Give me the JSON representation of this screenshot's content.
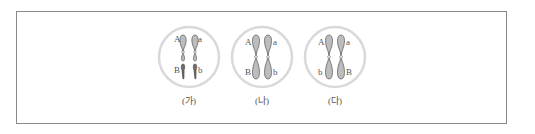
{
  "figure": {
    "cells": [
      {
        "label": "(가)",
        "description": "two pairs of homologous chromosomes (separate)",
        "chromosomes": [
          {
            "side": "left",
            "genes": [
              "A",
              "B"
            ],
            "structure": "separate"
          },
          {
            "side": "right",
            "genes": [
              "a",
              "b"
            ],
            "structure": "separate"
          }
        ],
        "gene_labels": {
          "top_left": "A",
          "top_right": "a",
          "bottom_left": "B",
          "bottom_right": "b"
        }
      },
      {
        "label": "(나)",
        "description": "one pair of homologous chromosomes, linked genes",
        "gene_labels": {
          "top_left": "A",
          "top_right": "a",
          "bottom_left": "B",
          "bottom_right": "b"
        }
      },
      {
        "label": "(다)",
        "description": "one pair of homologous chromosomes, linked genes (trans)",
        "gene_labels": {
          "top_left": "A",
          "top_right": "a",
          "bottom_left": "b",
          "bottom_right": "B"
        }
      }
    ],
    "colors": {
      "circle": "#d9d9d9",
      "chromosome_fill": "#bdbdbd",
      "chromosome_dark": "#6e6e6e",
      "outline": "#555555",
      "frame": "#8a8a8a"
    }
  }
}
